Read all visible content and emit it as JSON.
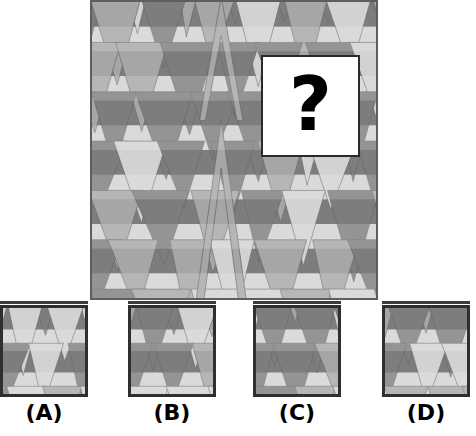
{
  "puzzle": {
    "type": "pattern-completion",
    "prompt_symbol": "?",
    "palette": {
      "light": "#d2d2d2",
      "mid": "#a6a6a6",
      "dark": "#7d7d7d",
      "background": "#9a9a9a",
      "outline": "#6a6a6a",
      "panel_border": "#5e5e5e",
      "option_border": "#2f2f2f",
      "box_fill": "#ffffff",
      "box_border": "#2a2a2a",
      "text": "#000000"
    },
    "main_panel": {
      "label": "main-pattern",
      "x": 90,
      "y": 0,
      "width": 288,
      "height": 300,
      "tile_cols": 6,
      "tile_rows": 6,
      "band_count": 12,
      "band_colors": [
        "dark",
        "light",
        "dark",
        "light",
        "dark",
        "light",
        "dark",
        "light",
        "dark",
        "light",
        "dark",
        "light"
      ],
      "motif": "inverted-triangle-tessellation"
    },
    "question_box": {
      "x": 261,
      "y": 55,
      "width": 99,
      "height": 102,
      "glyph": "?"
    }
  },
  "options": [
    {
      "id": "A",
      "label": "(A)",
      "x": 0,
      "y": 305,
      "width": 88,
      "height": 92,
      "description": "single large dark inverted triangle centered, light bands",
      "seed": 11
    },
    {
      "id": "B",
      "label": "(B)",
      "x": 128,
      "y": 305,
      "width": 88,
      "height": 92,
      "description": "two stacked inverted triangles, split horizontally at mid-height",
      "seed": 23
    },
    {
      "id": "C",
      "label": "(C)",
      "x": 253,
      "y": 305,
      "width": 88,
      "height": 92,
      "description": "wide dark inverted triangle with light flanking wedges",
      "seed": 37
    },
    {
      "id": "D",
      "label": "(D)",
      "x": 382,
      "y": 305,
      "width": 88,
      "height": 92,
      "description": "upward pointing triangle between two inverted triangles",
      "seed": 51
    }
  ]
}
